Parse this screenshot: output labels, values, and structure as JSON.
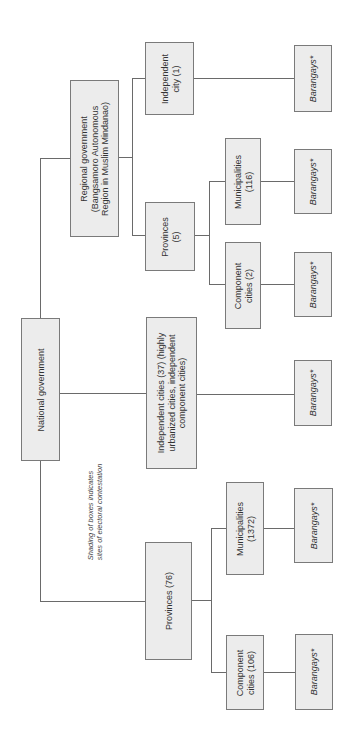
{
  "diagram": {
    "root": "National government",
    "note": "Shading of boxes indicates\nsites of electoral contestation",
    "nodes": {
      "national": "National government",
      "regional": "Regional government\n(Bangsamoro Autonomous\nRegion in Muslim Mindanao)",
      "independent_city_1": "Independent\ncity (1)",
      "provinces_5": "Provinces\n(5)",
      "municipalities_116": "Municipalities\n(116)",
      "component_cities_2": "Component\ncities (2)",
      "independent_cities_37": "Independent cities (37) (highly\nurbanized cities, independent\ncomponent cities)",
      "provinces_76": "Provinces (76)",
      "municipalities_1372": "Municipalities\n(1372)",
      "component_cities_106": "Component\ncities (106)",
      "barangays": "Barangays*"
    },
    "edges": [
      [
        "National government",
        "Regional government"
      ],
      [
        "National government",
        "Independent cities (37)"
      ],
      [
        "National government",
        "Provinces (76)"
      ],
      [
        "Regional government",
        "Independent city (1)"
      ],
      [
        "Regional government",
        "Provinces (5)"
      ],
      [
        "Provinces (5)",
        "Municipalities (116)"
      ],
      [
        "Provinces (5)",
        "Component cities (2)"
      ],
      [
        "Provinces (76)",
        "Municipalities (1372)"
      ],
      [
        "Provinces (76)",
        "Component cities (106)"
      ],
      [
        "Independent city (1)",
        "Barangays*"
      ],
      [
        "Municipalities (116)",
        "Barangays*"
      ],
      [
        "Component cities (2)",
        "Barangays*"
      ],
      [
        "Independent cities (37)",
        "Barangays*"
      ],
      [
        "Municipalities (1372)",
        "Barangays*"
      ],
      [
        "Component cities (106)",
        "Barangays*"
      ]
    ],
    "colors": {
      "box_fill": "#ececec",
      "box_border": "#7a7a7a",
      "line": "#6a6a6a"
    }
  }
}
